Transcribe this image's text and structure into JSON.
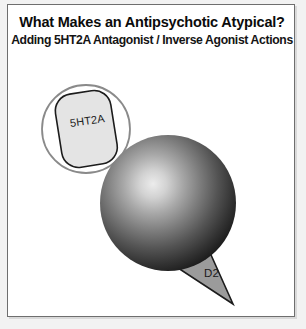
{
  "panel": {
    "background_color": "#ffffff",
    "border_color": "#6e6e6e",
    "outer_background": "#f2f2f2"
  },
  "title": {
    "main": "What Makes an Antipsychotic Atypical?",
    "subtitle": "Adding 5HT2A Antagonist / Inverse Agonist Actions"
  },
  "diagram": {
    "type": "receptor-binding-schematic",
    "shapes": [
      {
        "name": "receptor-circle-outline",
        "role": "5HT2A receptor site outline",
        "geometry": "circle",
        "cx": 78,
        "cy": 124,
        "r": 44,
        "stroke": "#808080",
        "fill": "none"
      },
      {
        "name": "ht2a-ligand",
        "role": "5HT2A antagonist / inverse agonist ligand",
        "geometry": "rounded-rectangle",
        "label": "5HT2A",
        "rotation_deg": -8,
        "fill": "#e6e6e6",
        "stroke": "#1a1a1a"
      },
      {
        "name": "drug-sphere",
        "role": "antipsychotic drug molecule",
        "geometry": "sphere",
        "cx": 160,
        "cy": 198,
        "r": 68,
        "gradient": {
          "highlight_color": "#e8e8e8",
          "mid_color": "#7a7a7a",
          "edge_color": "#181818",
          "highlight_cx": 145,
          "highlight_cy": 188
        }
      },
      {
        "name": "d2-ligand",
        "role": "D2 antagonist ligand wedge",
        "geometry": "triangle",
        "label": "D2",
        "fill": "#9a9a9a",
        "stroke": "#1a1a1a"
      }
    ],
    "labels": {
      "ht2a": "5HT2A",
      "d2": "D2"
    }
  }
}
